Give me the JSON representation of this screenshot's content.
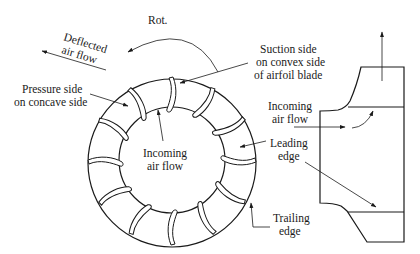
{
  "diagram": {
    "type": "centrifugal-fan-impeller",
    "colors": {
      "line": "#1a1a1a",
      "background": "#ffffff"
    },
    "labels": {
      "rotation": "Rot.",
      "deflected_1": "Deflected",
      "deflected_2": "air flow",
      "pressure_1": "Pressure side",
      "pressure_2": "on concave side",
      "suction_1": "Suction side",
      "suction_2": "on convex side",
      "suction_3": "of airfoil blade",
      "incoming_center_1": "Incoming",
      "incoming_center_2": "air flow",
      "incoming_side_1": "Incoming",
      "incoming_side_2": "air flow",
      "leading_1": "Leading",
      "leading_2": "edge",
      "trailing_1": "Trailing",
      "trailing_2": "edge"
    },
    "impeller": {
      "blade_count": 12,
      "outer_radius": 84,
      "inner_radius": 53
    }
  }
}
